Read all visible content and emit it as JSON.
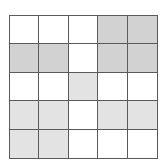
{
  "grid": {
    "rows": 5,
    "cols": 5,
    "colors": {
      "W": "#ffffff",
      "D": "#d2d2d2",
      "L": "#e3e3e3"
    },
    "cells": [
      [
        "W",
        "W",
        "W",
        "D",
        "D"
      ],
      [
        "D",
        "D",
        "W",
        "D",
        "D"
      ],
      [
        "W",
        "W",
        "L",
        "W",
        "W"
      ],
      [
        "L",
        "L",
        "W",
        "L",
        "L"
      ],
      [
        "L",
        "L",
        "W",
        "W",
        "W"
      ]
    ],
    "line_color": "#5a5a5a"
  }
}
